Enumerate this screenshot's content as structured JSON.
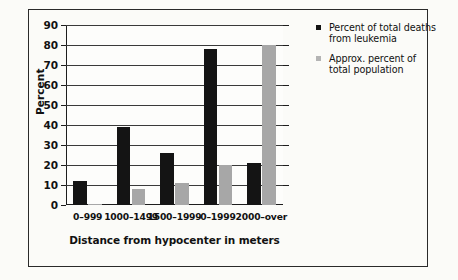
{
  "chart_data": {
    "type": "bar",
    "title": "",
    "xlabel": "Distance from hypocenter in meters",
    "ylabel": "Percent",
    "categories": [
      "0–999",
      "1000–1499",
      "1500–1999",
      "0–1999",
      "2000–over"
    ],
    "series": [
      {
        "name": "Percent of total deaths from leukemia",
        "color": "#141414",
        "values": [
          12,
          39,
          26,
          78,
          21
        ]
      },
      {
        "name": "Approx. percent of total population",
        "color": "#a7a7a7",
        "values": [
          0.5,
          8,
          11,
          20,
          80
        ]
      }
    ],
    "ylim": [
      0,
      90
    ],
    "yticks": [
      0,
      10,
      20,
      30,
      40,
      50,
      60,
      70,
      80,
      90
    ],
    "grid": true,
    "legend_position": "right"
  },
  "legend": {
    "entries": [
      {
        "swatch": "black",
        "line1": "Percent of total deaths",
        "line2": "from leukemia"
      },
      {
        "swatch": "gray",
        "line1": "Approx. percent of",
        "line2": "total population"
      }
    ]
  }
}
